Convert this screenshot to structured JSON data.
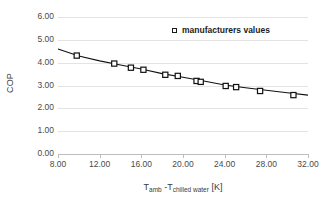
{
  "chart_data": {
    "type": "scatter",
    "title": "",
    "xlabel": "T amb - T chilled water [K]",
    "xlabel_parts": {
      "base1": "T",
      "sub1": "amb",
      "sep": " -",
      "base2": "T",
      "sub2": "chilled water",
      "unit": " [K]"
    },
    "ylabel": "COP",
    "xlim": [
      8.0,
      32.0
    ],
    "ylim": [
      0.0,
      6.0
    ],
    "xticks": [
      "8.00",
      "12.00",
      "16.00",
      "20.00",
      "24.00",
      "28.00",
      "32.00"
    ],
    "xtick_values": [
      8,
      12,
      16,
      20,
      24,
      28,
      32
    ],
    "yticks": [
      "0.00",
      "1.00",
      "2.00",
      "3.00",
      "4.00",
      "5.00",
      "6.00"
    ],
    "ytick_values": [
      0,
      1,
      2,
      3,
      4,
      5,
      6
    ],
    "grid": "horizontal",
    "legend_position": "top-right",
    "series": [
      {
        "name": "manufacturers  values",
        "marker": "open-square",
        "color": "#111111",
        "x": [
          9.8,
          13.4,
          15.0,
          16.2,
          18.3,
          19.5,
          21.3,
          21.7,
          24.1,
          25.1,
          27.4,
          30.6
        ],
        "values": [
          4.31,
          3.96,
          3.78,
          3.69,
          3.47,
          3.42,
          3.2,
          3.16,
          2.98,
          2.93,
          2.76,
          2.58
        ]
      },
      {
        "name": "fit-line",
        "marker": "none",
        "color": "#111111",
        "x": [
          8.0,
          10.0,
          12.0,
          14.0,
          16.0,
          18.0,
          20.0,
          22.0,
          24.0,
          26.0,
          28.0,
          30.0,
          32.0
        ],
        "values": [
          4.6,
          4.29,
          4.08,
          3.9,
          3.72,
          3.52,
          3.36,
          3.2,
          3.02,
          2.9,
          2.79,
          2.68,
          2.58
        ]
      }
    ]
  },
  "legend": {
    "label": "manufacturers  values",
    "marker_icon": "open-square-marker-icon"
  },
  "axes": {
    "y_title": "COP"
  }
}
